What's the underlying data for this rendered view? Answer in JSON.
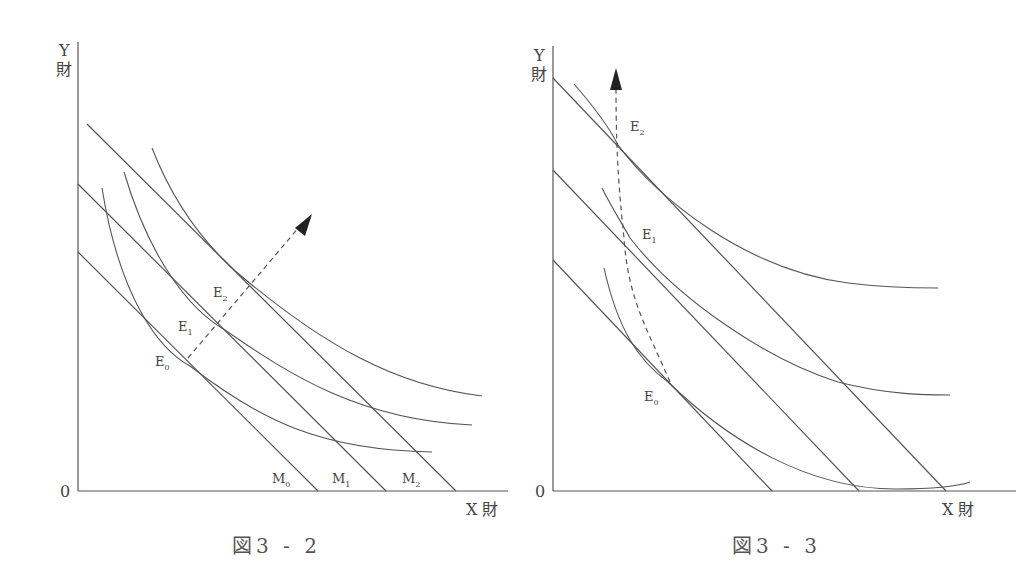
{
  "figures": [
    {
      "id": "fig-3-2",
      "caption": "図3 - 2",
      "y_axis_label_top": "Y",
      "y_axis_label_bottom": "財",
      "x_axis_label": "X 財",
      "origin_label": "0",
      "points": [
        {
          "name": "E",
          "sub": "0"
        },
        {
          "name": "E",
          "sub": "1"
        },
        {
          "name": "E",
          "sub": "2"
        }
      ],
      "budget_lines": [
        {
          "name": "M",
          "sub": "0"
        },
        {
          "name": "M",
          "sub": "1"
        },
        {
          "name": "M",
          "sub": "2"
        }
      ],
      "description": "Parallel budget lines M0, M1, M2 shifting outward; indifference curves tangent at E0, E1, E2; dashed arrow showing income expansion path"
    },
    {
      "id": "fig-3-3",
      "caption": "図3 - 3",
      "y_axis_label_top": "Y",
      "y_axis_label_bottom": "財",
      "x_axis_label": "X 財",
      "origin_label": "0",
      "points": [
        {
          "name": "E",
          "sub": "0"
        },
        {
          "name": "E",
          "sub": "1"
        },
        {
          "name": "E",
          "sub": "2"
        }
      ],
      "description": "Budget lines rotating/shifting with indifference curves tangent at E0, E1, E2; dashed upward arrow path"
    }
  ],
  "colors": {
    "line": "#555555",
    "text": "#444444",
    "arrow": "#222222"
  }
}
